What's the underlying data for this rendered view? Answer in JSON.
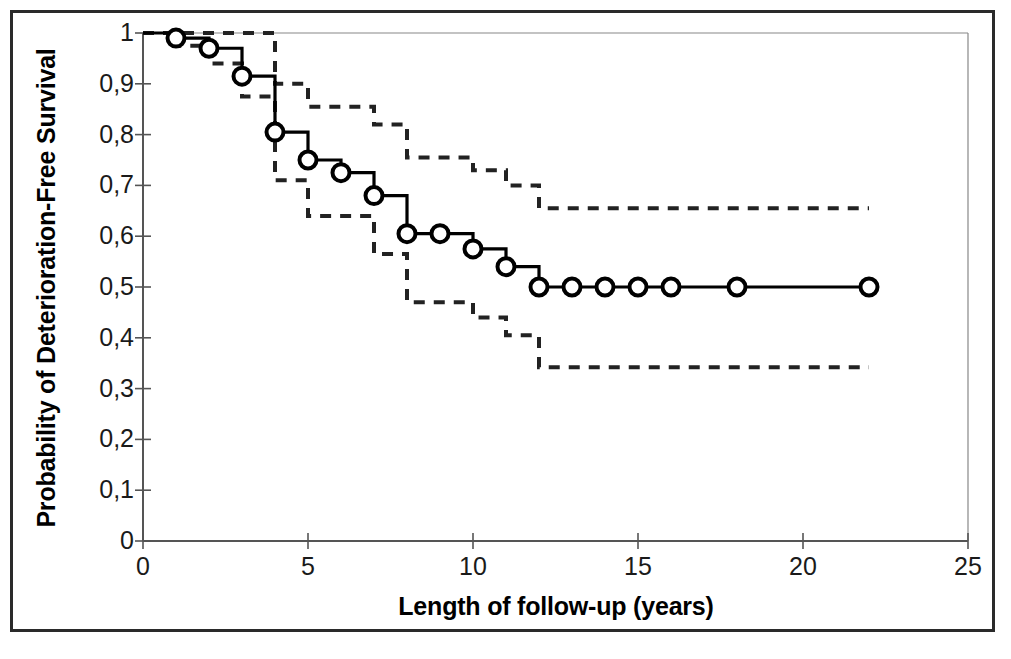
{
  "chart_data": {
    "type": "line",
    "subtype": "kaplan-meier-step",
    "title": "",
    "xlabel": "Length of follow-up (years)",
    "ylabel": "Probability of Deterioration-Free Survival",
    "xlim": [
      0,
      25
    ],
    "ylim": [
      0,
      1
    ],
    "grid": false,
    "legend": "none",
    "xticks": [
      0,
      5,
      10,
      15,
      20,
      25
    ],
    "xtick_labels": [
      "0",
      "5",
      "10",
      "15",
      "20",
      "25"
    ],
    "yticks": [
      0,
      0.1,
      0.2,
      0.3,
      0.4,
      0.5,
      0.6,
      0.7,
      0.8,
      0.9,
      1
    ],
    "ytick_labels": [
      "0",
      "0,1",
      "0,2",
      "0,3",
      "0,4",
      "0,5",
      "0,6",
      "0,7",
      "0,8",
      "0,9",
      "1"
    ],
    "decimal_separator": ",",
    "series": [
      {
        "name": "Deterioration-free survival estimate",
        "style": "solid",
        "color": "#000000",
        "marker": "open-circle",
        "x": [
          0,
          1,
          2,
          3,
          4,
          5,
          6,
          7,
          8,
          9,
          10,
          11,
          12,
          13,
          14,
          15,
          16,
          18,
          22
        ],
        "values": [
          1.0,
          0.99,
          0.97,
          0.915,
          0.805,
          0.75,
          0.725,
          0.68,
          0.605,
          0.605,
          0.575,
          0.54,
          0.5,
          0.5,
          0.5,
          0.5,
          0.5,
          0.5,
          0.5
        ]
      },
      {
        "name": "Upper 95% confidence limit",
        "style": "dashed",
        "color": "#222222",
        "marker": "none",
        "x": [
          0,
          1,
          2,
          3,
          4,
          5,
          6,
          7,
          8,
          9,
          10,
          11,
          12,
          22
        ],
        "values": [
          1.0,
          1.0,
          1.0,
          1.0,
          0.9,
          0.855,
          0.855,
          0.82,
          0.755,
          0.755,
          0.73,
          0.7,
          0.655,
          0.655
        ]
      },
      {
        "name": "Lower 95% confidence limit",
        "style": "dashed",
        "color": "#222222",
        "marker": "none",
        "x": [
          0,
          1,
          2,
          3,
          4,
          5,
          6,
          7,
          8,
          9,
          10,
          11,
          12,
          22
        ],
        "values": [
          1.0,
          0.975,
          0.94,
          0.875,
          0.71,
          0.64,
          0.64,
          0.565,
          0.47,
          0.47,
          0.44,
          0.405,
          0.342,
          0.342
        ]
      }
    ],
    "censor_marker_x": [
      1,
      2,
      3,
      4,
      5,
      6,
      7,
      8,
      9,
      10,
      11,
      12,
      13,
      14,
      15,
      16,
      18,
      22
    ],
    "censor_marker_y": [
      0.99,
      0.97,
      0.915,
      0.805,
      0.75,
      0.725,
      0.68,
      0.605,
      0.605,
      0.575,
      0.54,
      0.5,
      0.5,
      0.5,
      0.5,
      0.5,
      0.5,
      0.5
    ]
  },
  "axes": {
    "y_title": "Probability of Deterioration-Free Survival",
    "x_title": "Length of follow-up (years)"
  },
  "colors": {
    "curve": "#000000",
    "confidence_band": "#222222",
    "axis": "#555555",
    "frame": "#2a2a2a",
    "background": "#ffffff"
  }
}
